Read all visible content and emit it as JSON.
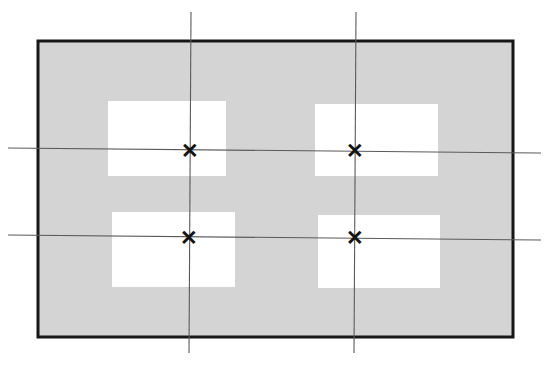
{
  "figure": {
    "canvas": {
      "width": 546,
      "height": 365,
      "background": "#ffffff"
    }
  },
  "plate": {
    "name": "outer-plate",
    "label": "Plate",
    "x": 38,
    "y": 41,
    "width": 475,
    "height": 296,
    "fill": "#d4d4d4",
    "stroke": "#161616",
    "stroke_width": 3
  },
  "windows": [
    {
      "id": "window-top-left",
      "label": "Top Left Window",
      "x": 108,
      "y": 101,
      "width": 118,
      "height": 75,
      "fill": "#ffffff"
    },
    {
      "id": "window-top-right",
      "label": "Top Right Window",
      "x": 315,
      "y": 104,
      "width": 123,
      "height": 72,
      "fill": "#ffffff"
    },
    {
      "id": "window-bottom-left",
      "label": "Bottom Left Window",
      "x": 112,
      "y": 212,
      "width": 123,
      "height": 75,
      "fill": "#ffffff"
    },
    {
      "id": "window-bottom-right",
      "label": "Bottom Right Window",
      "x": 318,
      "y": 215,
      "width": 122,
      "height": 73,
      "fill": "#ffffff"
    }
  ],
  "centerlines": {
    "stroke": "#5a5a5a",
    "stroke_width": 1.1,
    "vertical": [
      {
        "id": "centerline-vertical-left",
        "label": "Left Vertical Centerline",
        "x1": 191,
        "y1": 12,
        "x2": 189,
        "y2": 353
      },
      {
        "id": "centerline-vertical-right",
        "label": "Right Vertical Centerline",
        "x1": 356,
        "y1": 12,
        "x2": 354,
        "y2": 353
      }
    ],
    "horizontal": [
      {
        "id": "centerline-horizontal-upper",
        "label": "Upper Horizontal Centerline",
        "x1": 8,
        "y1": 148,
        "x2": 541,
        "y2": 153
      },
      {
        "id": "centerline-horizontal-lower",
        "label": "Lower Horizontal Centerline",
        "x1": 8,
        "y1": 235,
        "x2": 541,
        "y2": 240
      }
    ]
  },
  "markers": [
    {
      "id": "marker-top-left",
      "label": "Center Mark Top Left",
      "glyph": "✕",
      "x": 190,
      "y": 150
    },
    {
      "id": "marker-top-right",
      "label": "Center Mark Top Right",
      "glyph": "✕",
      "x": 355,
      "y": 150
    },
    {
      "id": "marker-bottom-left",
      "label": "Center Mark Bottom Left",
      "glyph": "✕",
      "x": 189,
      "y": 237
    },
    {
      "id": "marker-bottom-right",
      "label": "Center Mark Bottom Right",
      "glyph": "✕",
      "x": 355,
      "y": 237
    }
  ]
}
